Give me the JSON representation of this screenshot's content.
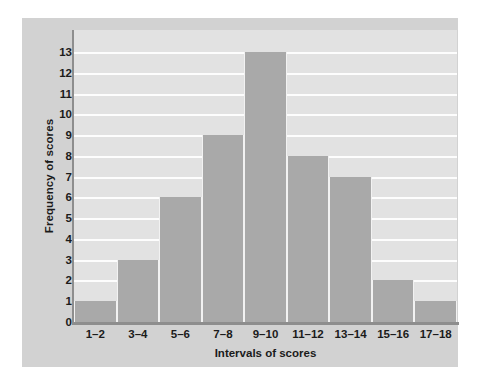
{
  "chart_data": {
    "type": "bar",
    "title": "",
    "xlabel": "Intervals of scores",
    "ylabel": "Frequency of scores",
    "categories": [
      "1–2",
      "3–4",
      "5–6",
      "7–8",
      "9–10",
      "11–12",
      "13–14",
      "15–16",
      "17–18"
    ],
    "values": [
      1,
      3,
      6,
      9,
      13,
      8,
      7,
      2,
      1
    ],
    "ylim": [
      0,
      13
    ],
    "yticks": [
      0,
      1,
      2,
      3,
      4,
      5,
      6,
      7,
      8,
      9,
      10,
      11,
      12,
      13
    ],
    "ytick_labels": [
      "0",
      "1",
      "2",
      "3",
      "4",
      "5",
      "6",
      "7",
      "8",
      "9",
      "10",
      "11",
      "12",
      "13"
    ],
    "grid": true,
    "grid_axis": "y",
    "legend": false,
    "legend_position": "none",
    "bar_color": "#a9a9a9",
    "plot_background": "#e2e2e2",
    "panel_background": "#d2d2d2",
    "gridline_color": "#fdfdfd",
    "axis_color": "#8e8e8e",
    "text_color": "#1b1b1b"
  }
}
